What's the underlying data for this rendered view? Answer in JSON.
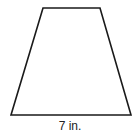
{
  "figure": {
    "shape": "trapezoid",
    "bottom_base_label": "7 in.",
    "stroke_color": "#1a1a1a",
    "fill_color": "#ffffff"
  }
}
